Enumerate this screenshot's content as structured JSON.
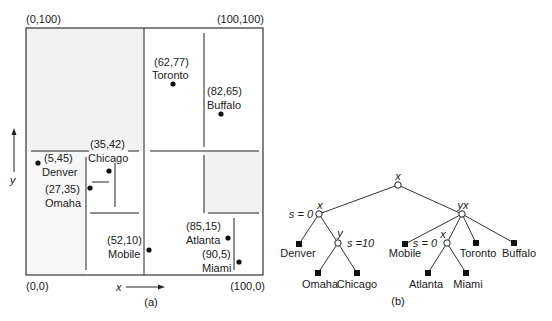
{
  "figure_a": {
    "caption": "(a)",
    "corners": {
      "top_left": "(0,100)",
      "top_right": "(100,100)",
      "bottom_left": "(0,0)",
      "bottom_right": "(100,0)"
    },
    "axis_x_label": "x",
    "axis_y_label": "y",
    "points": [
      {
        "name": "Toronto",
        "coord": "(62,77)"
      },
      {
        "name": "Buffalo",
        "coord": "(82,65)"
      },
      {
        "name": "Chicago",
        "coord": "(35,42)"
      },
      {
        "name": "Denver",
        "coord": "(5,45)"
      },
      {
        "name": "Omaha",
        "coord": "(27,35)"
      },
      {
        "name": "Mobile",
        "coord": "(52,10)"
      },
      {
        "name": "Atlanta",
        "coord": "(85,15)"
      },
      {
        "name": "Miami",
        "coord": "(90,5)"
      }
    ]
  },
  "figure_b": {
    "caption": "(b)",
    "nodes": {
      "root": "x",
      "left": "x",
      "left_s": "s = 0",
      "left_inner": "y",
      "left_inner_s": "s =10",
      "right": "yx",
      "right_inner": "x",
      "right_inner_s": "s = 0"
    },
    "leaves": {
      "denver": "Denver",
      "omaha": "Omaha",
      "chicago": "Chicago",
      "mobile": "Mobile",
      "atlanta": "Atlanta",
      "miami": "Miami",
      "toronto": "Toronto",
      "buffalo": "Buffalo"
    }
  }
}
